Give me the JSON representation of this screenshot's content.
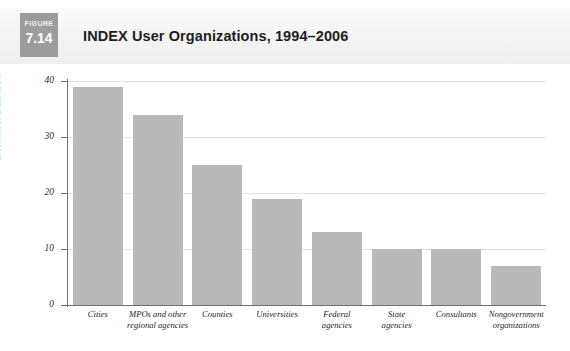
{
  "figure": {
    "tag_word": "FIGURE",
    "tag_number": "7.14",
    "title": "INDEX User Organizations, 1994–2006",
    "tag_bg_color": "#9c9c9c",
    "header_bg_color": "#f2f2f2"
  },
  "chart_data": {
    "type": "bar",
    "title": "INDEX User Organizations, 1994–2006",
    "xlabel": "",
    "ylabel": "Licensed INDEX users",
    "ylim": [
      0,
      40
    ],
    "yticks": [
      0,
      10,
      20,
      30,
      40
    ],
    "ytick_labels": [
      "0",
      "10",
      "20",
      "30",
      "40"
    ],
    "grid": true,
    "legend": false,
    "bar_color": "#b9b9b9",
    "categories": [
      "Cities",
      "MPOs and other regional agencies",
      "Counties",
      "Universities",
      "Federal agencies",
      "State agencies",
      "Consultants",
      "Nongovernment organizations"
    ],
    "category_lines": [
      [
        "Cities"
      ],
      [
        "MPOs and other",
        "regional agencies"
      ],
      [
        "Counties"
      ],
      [
        "Universities"
      ],
      [
        "Federal",
        "agencies"
      ],
      [
        "State",
        "agencies"
      ],
      [
        "Consultants"
      ],
      [
        "Nongovernment",
        "organizations"
      ]
    ],
    "values": [
      39,
      34,
      25,
      19,
      13,
      10,
      10,
      7
    ]
  }
}
